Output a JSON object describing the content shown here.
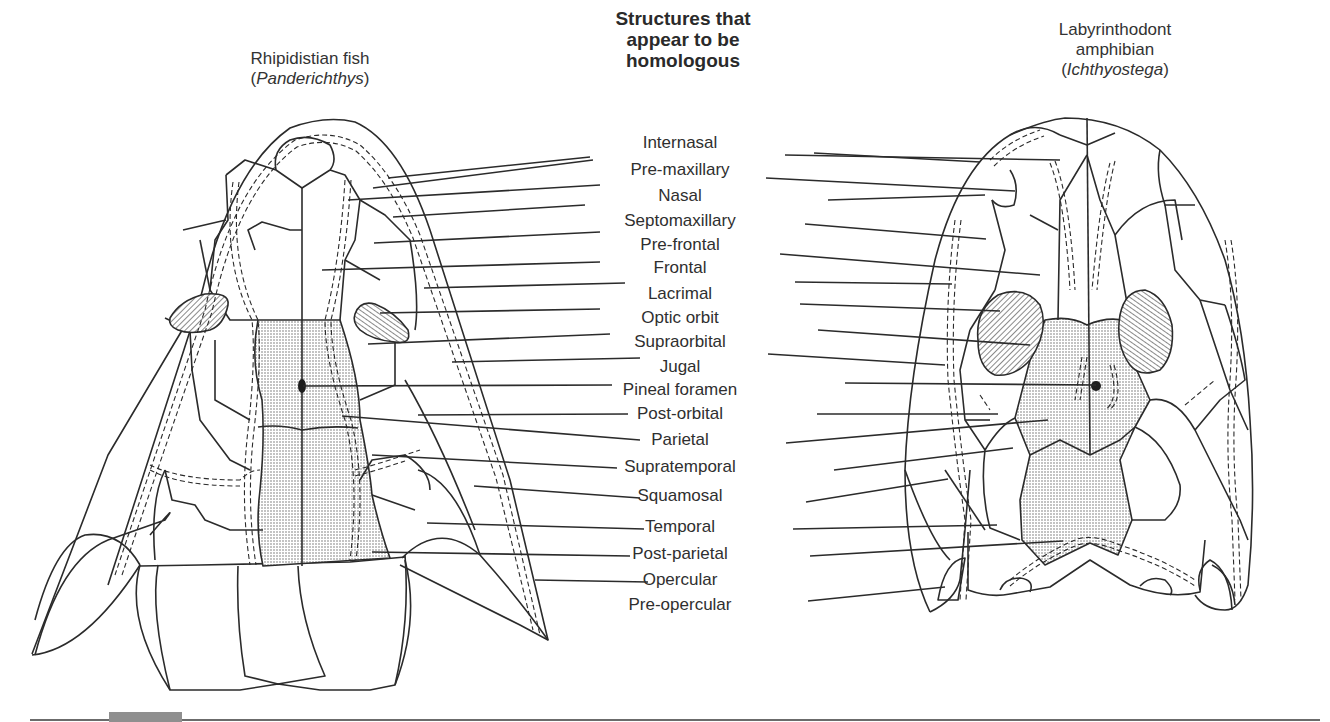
{
  "header": {
    "center_title_lines": [
      "Structures that",
      "appear to be",
      "homologous"
    ],
    "left_organism": {
      "common": "Rhipidistian fish",
      "genus": "Panderichthys"
    },
    "right_organism": {
      "common_lines": [
        "Labyrinthodont",
        "amphibian"
      ],
      "genus": "Ichthyostega"
    }
  },
  "labels": [
    {
      "text": "Internasal",
      "cx": 680,
      "y": 143,
      "left_end": [
        373,
        188
      ],
      "left_start": [
        593,
        160
      ],
      "right_start": [
        785,
        155
      ],
      "right_end": [
        1060,
        160
      ]
    },
    {
      "text": "Pre-maxillary",
      "cx": 680,
      "y": 170,
      "left_end": [
        388,
        178
      ],
      "left_start": [
        590,
        157
      ],
      "right_start": [
        814,
        153
      ],
      "right_end": [
        980,
        162
      ]
    },
    {
      "text": "Nasal",
      "cx": 680,
      "y": 196,
      "left_end": [
        348,
        200
      ],
      "left_start": [
        600,
        185
      ],
      "right_start": [
        766,
        178
      ],
      "right_end": [
        1015,
        191
      ]
    },
    {
      "text": "Septomaxillary",
      "cx": 680,
      "y": 221,
      "left_end": [
        393,
        217
      ],
      "left_start": [
        585,
        205
      ],
      "right_start": [
        828,
        200
      ],
      "right_end": [
        985,
        195
      ]
    },
    {
      "text": "Pre-frontal",
      "cx": 680,
      "y": 245,
      "left_end": [
        374,
        243
      ],
      "left_start": [
        600,
        232
      ],
      "right_start": [
        805,
        224
      ],
      "right_end": [
        986,
        239
      ]
    },
    {
      "text": "Frontal",
      "cx": 680,
      "y": 268,
      "left_end": [
        322,
        270
      ],
      "left_start": [
        600,
        262
      ],
      "right_start": [
        780,
        254
      ],
      "right_end": [
        1040,
        275
      ]
    },
    {
      "text": "Lacrimal",
      "cx": 680,
      "y": 294,
      "left_end": [
        424,
        288
      ],
      "left_start": [
        625,
        283
      ],
      "right_start": [
        795,
        282
      ],
      "right_end": [
        952,
        284
      ]
    },
    {
      "text": "Optic orbit",
      "cx": 680,
      "y": 318,
      "left_end": [
        380,
        313
      ],
      "left_start": [
        600,
        309
      ],
      "right_start": [
        800,
        304
      ],
      "right_end": [
        1000,
        311
      ]
    },
    {
      "text": "Supraorbital",
      "cx": 680,
      "y": 342,
      "left_end": [
        368,
        344
      ],
      "left_start": [
        610,
        334
      ],
      "right_start": [
        818,
        330
      ],
      "right_end": [
        1030,
        345
      ]
    },
    {
      "text": "Jugal",
      "cx": 680,
      "y": 367,
      "left_end": [
        452,
        362
      ],
      "left_start": [
        640,
        358
      ],
      "right_start": [
        768,
        354
      ],
      "right_end": [
        945,
        365
      ]
    },
    {
      "text": "Pineal foramen",
      "cx": 680,
      "y": 390,
      "left_end": [
        303,
        386
      ],
      "left_start": [
        612,
        385
      ],
      "right_start": [
        845,
        383
      ],
      "right_end": [
        1096,
        385
      ]
    },
    {
      "text": "Post-orbital",
      "cx": 680,
      "y": 414,
      "left_end": [
        418,
        415
      ],
      "left_start": [
        628,
        414
      ],
      "right_start": [
        817,
        414
      ],
      "right_end": [
        998,
        414
      ]
    },
    {
      "text": "Parietal",
      "cx": 680,
      "y": 440,
      "left_end": [
        342,
        416
      ],
      "left_start": [
        640,
        440
      ],
      "right_start": [
        786,
        443
      ],
      "right_end": [
        1048,
        420
      ]
    },
    {
      "text": "Supratemporal",
      "cx": 680,
      "y": 467,
      "left_end": [
        372,
        455
      ],
      "left_start": [
        617,
        468
      ],
      "right_start": [
        834,
        470
      ],
      "right_end": [
        1013,
        448
      ]
    },
    {
      "text": "Squamosal",
      "cx": 680,
      "y": 496,
      "left_end": [
        474,
        486
      ],
      "left_start": [
        640,
        498
      ],
      "right_start": [
        806,
        502
      ],
      "right_end": [
        948,
        479
      ]
    },
    {
      "text": "Temporal",
      "cx": 680,
      "y": 527,
      "left_end": [
        427,
        523
      ],
      "left_start": [
        644,
        529
      ],
      "right_start": [
        793,
        529
      ],
      "right_end": [
        997,
        525
      ]
    },
    {
      "text": "Post-parietal",
      "cx": 680,
      "y": 554,
      "left_end": [
        372,
        552
      ],
      "left_start": [
        630,
        556
      ],
      "right_start": [
        810,
        556
      ],
      "right_end": [
        1063,
        541
      ]
    },
    {
      "text": "Opercular",
      "cx": 680,
      "y": 580,
      "left_end": [
        535,
        580
      ],
      "left_start": [
        648,
        582
      ],
      "right_start": null,
      "right_end": null
    },
    {
      "text": "Pre-opercular",
      "cx": 680,
      "y": 605,
      "left_end": null,
      "left_start": null,
      "right_start": [
        808,
        601
      ],
      "right_end": [
        945,
        587
      ]
    }
  ],
  "colors": {
    "line": "#2b2b2b",
    "stipple": "#bdbdbd",
    "hatch": "#3a3a3a",
    "tab": "#8f8f8f"
  }
}
